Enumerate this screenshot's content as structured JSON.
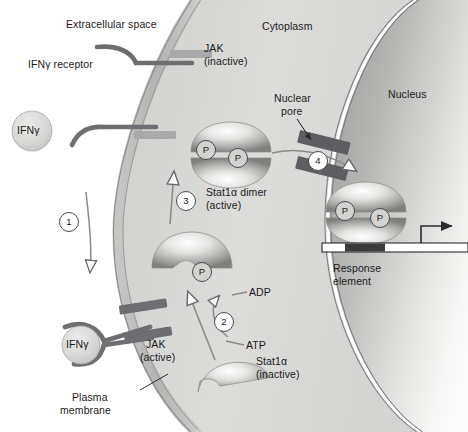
{
  "figure": {
    "width": 468,
    "height": 432
  },
  "colors": {
    "background": "#ffffff",
    "cytoplasm": "#d9d9d7",
    "membrane_band": "#bdbdbb",
    "membrane_line": "#8f8f8d",
    "nucleus_dark": "#a8a8a6",
    "nucleus_light": "#fbfbfb",
    "receptor": "#6e6e72",
    "jak_inactive": "#a9a9ab",
    "jak_active": "#6e6e72",
    "pore": "#5e5e62",
    "protein_dark": "#8e8e90",
    "protein_light": "#fdfdfd",
    "ifng_fill": "#d4d4d2",
    "dna_bar": "#ffffff",
    "response_element": "#3a3a3c",
    "text": "#1a1a1a"
  },
  "labels": {
    "extracellular_space": "Extracellular space",
    "cytoplasm": "Cytoplasm",
    "nucleus": "Nucleus",
    "ifng_receptor": "IFNγ receptor",
    "ifng_free": "IFNγ",
    "ifng_bound": "IFNγ",
    "jak_inactive_line1": "JAK",
    "jak_inactive_line2": "(inactive)",
    "jak_active_line1": "JAK",
    "jak_active_line2": "(active)",
    "nuclear_pore_line1": "Nuclear",
    "nuclear_pore_line2": "pore",
    "stat_dimer_line1": "Stat1α dimer",
    "stat_dimer_line2": "(active)",
    "stat_inactive_line1": "Stat1α",
    "stat_inactive_line2": "(inactive)",
    "plasma_membrane_line1": "Plasma",
    "plasma_membrane_line2": "membrane",
    "response_element_line1": "Response",
    "response_element_line2": "element",
    "adp": "ADP",
    "atp": "ATP",
    "phosphate": "P"
  },
  "steps": [
    {
      "id": "step-1",
      "number": "1"
    },
    {
      "id": "step-2",
      "number": "2"
    },
    {
      "id": "step-3",
      "number": "3"
    },
    {
      "id": "step-4",
      "number": "4"
    }
  ],
  "phosphates": [
    {
      "id": "p-dimer-left",
      "label": "P"
    },
    {
      "id": "p-dimer-right",
      "label": "P"
    },
    {
      "id": "p-monomer",
      "label": "P"
    },
    {
      "id": "p-nuclear-left",
      "label": "P"
    },
    {
      "id": "p-nuclear-right",
      "label": "P"
    }
  ]
}
